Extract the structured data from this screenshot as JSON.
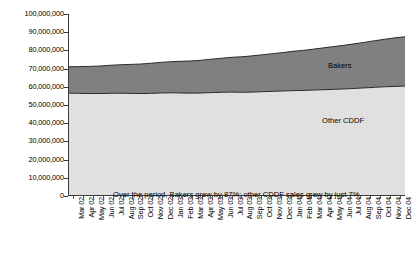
{
  "chart_data": {
    "type": "area",
    "title": "",
    "xlabel": "",
    "ylabel": "Volume (kg, MAT)",
    "ylim": [
      0,
      100000000
    ],
    "grid": false,
    "stacked": true,
    "legend_position": "inline-annotations",
    "annotation": "Over the period, Bakers grew by 87%; other CDDF sales grew by just 7%",
    "y_ticks": [
      "0",
      "10,000,000",
      "20,000,000",
      "30,000,000",
      "40,000,000",
      "50,000,000",
      "60,000,000",
      "70,000,000",
      "80,000,000",
      "90,000,000",
      "100,000,000"
    ],
    "y_tick_values": [
      0,
      10000000,
      20000000,
      30000000,
      40000000,
      50000000,
      60000000,
      70000000,
      80000000,
      90000000,
      100000000
    ],
    "categories": [
      "Mar 02",
      "Apr 02",
      "May 02",
      "Jun 02",
      "Jul 02",
      "Aug 02",
      "Sep 02",
      "Oct 02",
      "Nov 02",
      "Dec 02",
      "Jan 03",
      "Feb 03",
      "Mar 03",
      "Apr 03",
      "May 03",
      "Jun 03",
      "Jul 03",
      "Aug 03",
      "Sep 03",
      "Oct 03",
      "Nov 03",
      "Dec 03",
      "Jan 04",
      "Feb 04",
      "Mar 04",
      "Apr 04",
      "May 04",
      "Jun 04",
      "Jul 04",
      "Aug 04",
      "Sep 04",
      "Oct 04",
      "Nov 04",
      "Dec 04"
    ],
    "series": [
      {
        "name": "Other CDDF",
        "color": "#e0e0e0",
        "values": [
          56500000,
          56400000,
          56300000,
          56300000,
          56400000,
          56500000,
          56400000,
          56300000,
          56400000,
          56600000,
          56700000,
          56600000,
          56500000,
          56600000,
          56800000,
          57000000,
          57100000,
          57000000,
          57100000,
          57300000,
          57500000,
          57700000,
          57900000,
          58000000,
          58200000,
          58400000,
          58600000,
          58800000,
          59100000,
          59400000,
          59700000,
          60000000,
          60200000,
          60400000
        ]
      },
      {
        "name": "Bakers",
        "color": "#808080",
        "values": [
          14500000,
          14700000,
          14900000,
          15100000,
          15400000,
          15600000,
          15900000,
          16200000,
          16500000,
          16800000,
          17100000,
          17400000,
          17700000,
          18000000,
          18400000,
          18700000,
          19100000,
          19500000,
          19900000,
          20300000,
          20700000,
          21100000,
          21600000,
          22000000,
          22500000,
          23000000,
          23500000,
          24000000,
          24500000,
          25000000,
          25600000,
          26100000,
          26700000,
          27100000
        ]
      }
    ],
    "totals": [
      71000000,
      71100000,
      71200000,
      71400000,
      71800000,
      72100000,
      72300000,
      72500000,
      72900000,
      73400000,
      73800000,
      74000000,
      74200000,
      74600000,
      75200000,
      75700000,
      76200000,
      76500000,
      77000000,
      77600000,
      78200000,
      78800000,
      79500000,
      80000000,
      80700000,
      81400000,
      82100000,
      82800000,
      83600000,
      84400000,
      85300000,
      86100000,
      86900000,
      87500000
    ],
    "series_labels": [
      {
        "name": "Bakers",
        "text": "Bakers"
      },
      {
        "name": "Other CDDF",
        "text": "Other CDDF"
      }
    ]
  }
}
